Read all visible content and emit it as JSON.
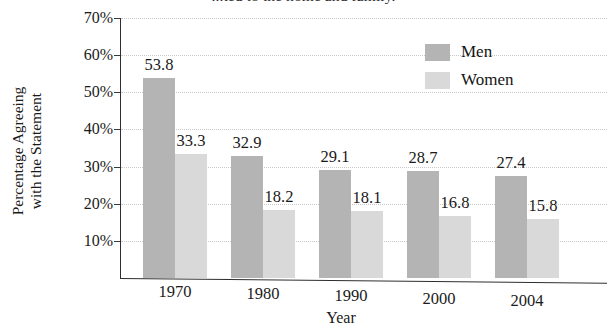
{
  "chart_data": {
    "type": "bar",
    "title": "...ted to the home and family.",
    "xlabel": "Year",
    "ylabel_line1": "Percentage Agreeing",
    "ylabel_line2": "with the Statement",
    "categories": [
      "1970",
      "1980",
      "1990",
      "2000",
      "2004"
    ],
    "series": [
      {
        "name": "Men",
        "values": [
          53.8,
          32.9,
          29.1,
          28.7,
          27.4
        ],
        "color": "#b4b4b4"
      },
      {
        "name": "Women",
        "values": [
          33.3,
          18.2,
          18.1,
          16.8,
          15.8
        ],
        "color": "#d9d9d9"
      }
    ],
    "ylim": [
      0,
      70
    ],
    "ytick_labels": [
      "70%",
      "60%",
      "50%",
      "40%",
      "30%",
      "20%",
      "10%"
    ],
    "ytick_values": [
      70,
      60,
      50,
      40,
      30,
      20,
      10
    ],
    "grid": true,
    "legend_position": "top-right"
  }
}
